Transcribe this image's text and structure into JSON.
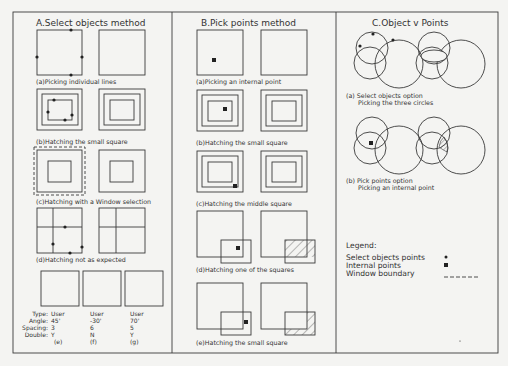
{
  "panels": [
    {
      "title": "A.Select objects method",
      "captions": [
        "(a)Picking individual lines",
        "(b)Hatching the small square",
        "(c)Hatching with a Window selection",
        "(d)Hatching not as expected"
      ],
      "hatch_table": {
        "row_labels": [
          "Type:",
          "Angle:",
          "Spacing:",
          "Double:"
        ],
        "columns": [
          {
            "type": "User",
            "angle": "45'",
            "spacing": "3",
            "double": "Y",
            "id": "(e)"
          },
          {
            "type": "User",
            "angle": "-30'",
            "spacing": "6",
            "double": "N",
            "id": "(f)"
          },
          {
            "type": "User",
            "angle": "70'",
            "spacing": "5",
            "double": "Y",
            "id": "(g)"
          }
        ]
      }
    },
    {
      "title": "B.Pick points method",
      "captions": [
        "(a)Picking an internal point",
        "(b)Hatching the small square",
        "(c)Hatching the middle square",
        "(d)Hatching one of the squares",
        "(e)Hatching the small square"
      ]
    },
    {
      "title": "C.Object v Points",
      "captions": [
        {
          "line1": "(a) Select objects option",
          "line2": "Picking the three circles"
        },
        {
          "line1": "(b) Pick points option",
          "line2": "Picking an internal point"
        }
      ],
      "legend": {
        "title": "Legend:",
        "items": [
          {
            "label": "Select objects points",
            "symbol": "small-dot"
          },
          {
            "label": "Internal points",
            "symbol": "small-square"
          },
          {
            "label": "Window boundary",
            "symbol": "dashed-line"
          }
        ]
      }
    }
  ],
  "colors": {
    "line": "#3a3a3a",
    "paper": "#f4f4f2",
    "hatch": "#555555"
  }
}
